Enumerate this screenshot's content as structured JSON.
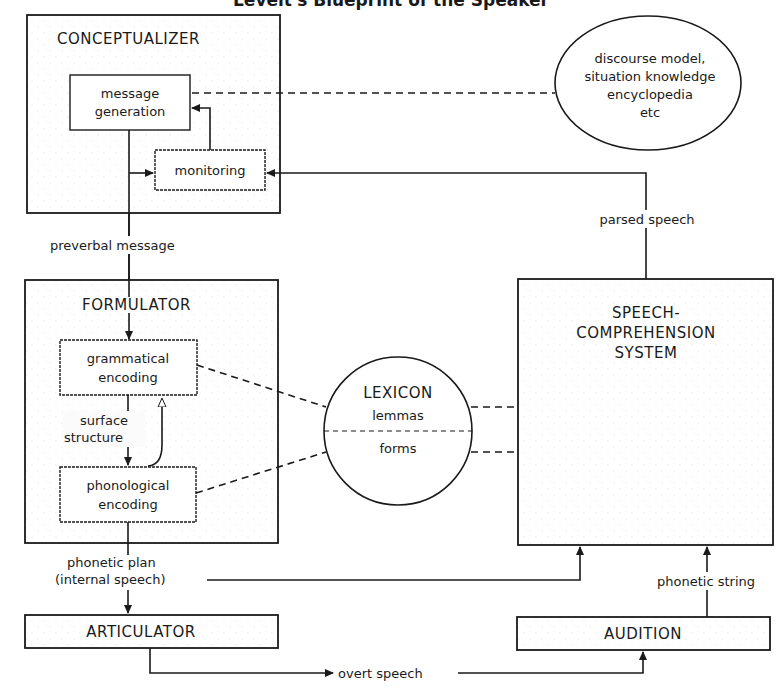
{
  "title": "Levelt's Blueprint of the Speaker",
  "conceptualizer": {
    "label": "CONCEPTUALIZER",
    "message_generation": [
      "message",
      "generation"
    ],
    "monitoring": "monitoring"
  },
  "knowledge": {
    "lines": [
      "discourse model,",
      "situation knowledge",
      "encyclopedia",
      "etc"
    ]
  },
  "connections": {
    "preverbal_message": "preverbal message",
    "parsed_speech": "parsed speech",
    "surface_structure": [
      "surface",
      "structure"
    ],
    "phonetic_plan": [
      "phonetic plan",
      "(internal speech)"
    ],
    "phonetic_string": "phonetic string",
    "overt_speech": "overt speech"
  },
  "formulator": {
    "label": "FORMULATOR",
    "grammatical_encoding": [
      "grammatical",
      "encoding"
    ],
    "phonological_encoding": [
      "phonological",
      "encoding"
    ]
  },
  "lexicon": {
    "label": "LEXICON",
    "upper": "lemmas",
    "lower": "forms"
  },
  "speech_comprehension": {
    "lines": [
      "SPEECH-",
      "COMPREHENSION",
      "SYSTEM"
    ]
  },
  "articulator": {
    "label": "ARTICULATOR"
  },
  "audition": {
    "label": "AUDITION"
  }
}
